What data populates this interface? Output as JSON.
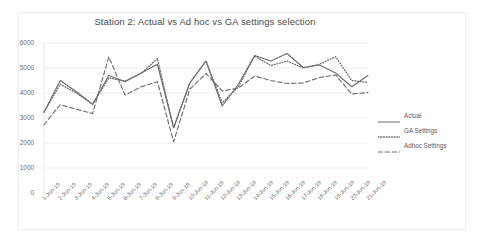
{
  "chart_data": {
    "type": "line",
    "title": "Station 2: Actual vs Ad hoc vs GA settings selection",
    "xlabel": "",
    "ylabel": "",
    "ylim": [
      0,
      6000
    ],
    "ytick_values": [
      0,
      1000,
      2000,
      3000,
      4000,
      5000,
      6000
    ],
    "ytick_labels": [
      "0",
      "1000",
      "2000",
      "3000",
      "4000",
      "5000",
      "6000"
    ],
    "grid": true,
    "legend_position": "right",
    "categories": [
      "1-Jun-19",
      "2-Jun-19",
      "3-Jun-19",
      "4-Jun-19",
      "5-Jun-19",
      "6-Jun-19",
      "7-Jun-19",
      "8-Jun-19",
      "9-Jun-19",
      "10-Jun-19",
      "11-Jun-19",
      "12-Jun-19",
      "13-Jun-19",
      "14-Jun-19",
      "15-Jun-19",
      "16-Jun-19",
      "17-Jun-19",
      "18-Jun-19",
      "19-Jun-19",
      "20-Jun-19",
      "21-Jun-19"
    ],
    "series": [
      {
        "name": "Actual",
        "style": "solid",
        "color": "#6e6e6e",
        "values": [
          3230,
          4500,
          4050,
          3550,
          4700,
          4450,
          4800,
          5150,
          2620,
          4400,
          5280,
          3480,
          4350,
          5500,
          5280,
          5580,
          5020,
          5120,
          4800,
          4250,
          4700
        ]
      },
      {
        "name": "GA Settings",
        "style": "dotted",
        "color": "#6e6e6e",
        "values": [
          3230,
          4350,
          4000,
          3550,
          4600,
          4480,
          4780,
          5380,
          2600,
          4400,
          5280,
          3600,
          4250,
          5480,
          5100,
          5280,
          5000,
          5150,
          5450,
          4500,
          4420
        ]
      },
      {
        "name": "Adhoc Settings",
        "style": "dashed",
        "color": "#6e6e6e",
        "values": [
          2730,
          3530,
          3350,
          3180,
          5450,
          3920,
          4250,
          4450,
          2050,
          4150,
          4780,
          4080,
          4200,
          4680,
          4500,
          4380,
          4400,
          4620,
          4720,
          3960,
          4020
        ]
      }
    ]
  },
  "legend": {
    "items": [
      {
        "label": "Actual",
        "style": "solid"
      },
      {
        "label": "GA Settings",
        "style": "dotted"
      },
      {
        "label": "Adhoc Settings",
        "style": "dashed"
      }
    ]
  }
}
